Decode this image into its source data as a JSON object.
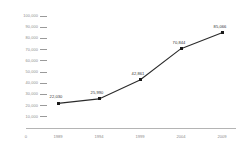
{
  "chart_data": {
    "type": "line",
    "title": "",
    "subtitle": "",
    "xlabel": "",
    "ylabel": "",
    "categories": [
      "1989",
      "1994",
      "1999",
      "2004",
      "2009"
    ],
    "values": [
      22030,
      25990,
      42861,
      70844,
      85066
    ],
    "point_labels": [
      "22,030",
      "25,990",
      "42,861",
      "70,844",
      "85,066"
    ],
    "series": [
      {
        "name": "series-1",
        "values": [
          22030,
          25990,
          42861,
          70844,
          85066
        ]
      }
    ],
    "ylim": [
      0,
      100000
    ],
    "ytick_values": [
      100000,
      90000,
      80000,
      70000,
      60000,
      50000,
      40000,
      30000,
      20000,
      10000
    ],
    "ytick_labels": [
      "100,000",
      "90,000",
      "80,000",
      "70,000",
      "60,000",
      "50,000",
      "40,000",
      "30,000",
      "20,000",
      "10,000"
    ],
    "origin_label": "0",
    "grid": false,
    "legend": "none",
    "colors": {
      "background": "#ffffff",
      "line": "#2b2b2b",
      "marker": "#1a1a1a",
      "axis": "#b4b4b4",
      "tick_text": "#8c8c8c",
      "point_label_text": "#333333"
    }
  }
}
